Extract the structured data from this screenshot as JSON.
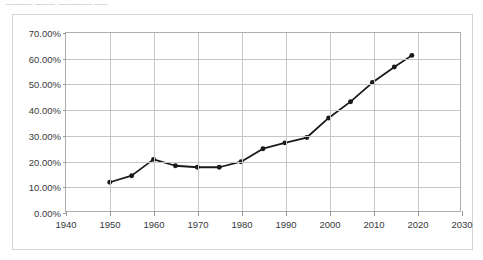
{
  "document": {
    "caption_fragment": "──── ─── ───── ──"
  },
  "chart_data": {
    "type": "line",
    "title": "",
    "subtitle": "",
    "xlabel": "",
    "ylabel": "",
    "xlim": [
      1940,
      2030
    ],
    "ylim": [
      0,
      0.7
    ],
    "grid": true,
    "legend": false,
    "legend_position": "none",
    "y_tick_format": "percent-2dp",
    "y_ticks": [
      0,
      0.1,
      0.2,
      0.3,
      0.4,
      0.5,
      0.6,
      0.7
    ],
    "y_tick_labels": [
      "0.00%",
      "10.00%",
      "20.00%",
      "30.00%",
      "40.00%",
      "50.00%",
      "60.00%",
      "70.00%"
    ],
    "x_ticks": [
      1940,
      1950,
      1960,
      1970,
      1980,
      1990,
      2000,
      2010,
      2020,
      2030
    ],
    "x_tick_labels": [
      "1940",
      "1950",
      "1960",
      "1970",
      "1980",
      "1990",
      "2000",
      "2010",
      "2020",
      "2030"
    ],
    "series": [
      {
        "name": "",
        "marker": "circle",
        "marker_size": 5,
        "line_width": 1.8,
        "color": "#1a1a1a",
        "x": [
          1950,
          1955,
          1960,
          1965,
          1970,
          1975,
          1980,
          1985,
          1990,
          1995,
          2000,
          2005,
          2010,
          2015,
          2019
        ],
        "y": [
          0.113,
          0.139,
          0.203,
          0.178,
          0.172,
          0.172,
          0.194,
          0.245,
          0.268,
          0.289,
          0.366,
          0.43,
          0.505,
          0.566,
          0.612
        ],
        "labels": [
          "11.30%",
          "13.90%",
          "20.30%",
          "17.80%",
          "17.20%",
          "17.20%",
          "19.40%",
          "24.50%",
          "26.80%",
          "28.90%",
          "36.60%",
          "43.00%",
          "50.50%",
          "56.60%",
          "61.20%"
        ]
      }
    ],
    "colors": {
      "series_line": "#1a1a1a",
      "grid": "#c6c6c9",
      "axis": "#adadb0",
      "frame": "#d3d3d6",
      "tick_text": "#3a3a3a",
      "background": "#ffffff"
    }
  }
}
